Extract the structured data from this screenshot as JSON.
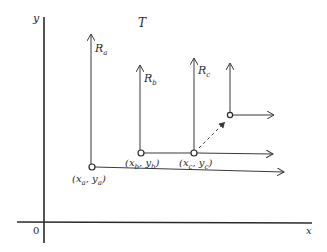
{
  "diagram": {
    "type": "coordinate-frames",
    "axes": {
      "x_label": "x",
      "y_label": "y",
      "origin_label": "0"
    },
    "region_label": "T",
    "frames": [
      {
        "id": "a",
        "axis_label": "R",
        "axis_sub": "a",
        "point_label": "(x",
        "point_label_x_sub": "a",
        "point_label_mid": ", y",
        "point_label_y_sub": "a",
        "point_label_end": ")"
      },
      {
        "id": "b",
        "axis_label": "R",
        "axis_sub": "b",
        "point_label": "(x",
        "point_label_x_sub": "b",
        "point_label_mid": ", y",
        "point_label_y_sub": "b",
        "point_label_end": ")"
      },
      {
        "id": "c",
        "axis_label": "R",
        "axis_sub": "c",
        "point_label": "(x",
        "point_label_x_sub": "c",
        "point_label_mid": ", y",
        "point_label_y_sub": "c",
        "point_label_end": ")"
      },
      {
        "id": "d",
        "axis_label": "",
        "note": "unlabeled frame, reached by dashed arrow from (x_c, y_c)"
      }
    ],
    "colors": {
      "line": "#3a3a3a",
      "text": "#2a2a2a",
      "background": "#ffffff"
    }
  }
}
